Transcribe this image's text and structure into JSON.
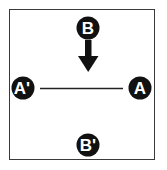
{
  "diagram": {
    "colors": {
      "node_fill": "#111111",
      "node_text": "#ffffff",
      "line": "#222222",
      "frame": "#3a3a3a"
    },
    "nodes": {
      "b_top": {
        "label": "B"
      },
      "a_prime": {
        "label": "A'"
      },
      "a": {
        "label": "A"
      },
      "b_prime": {
        "label": "B'"
      }
    },
    "arrow": {
      "from": "B",
      "direction": "down"
    },
    "connector": {
      "from": "A'",
      "to": "A"
    }
  }
}
